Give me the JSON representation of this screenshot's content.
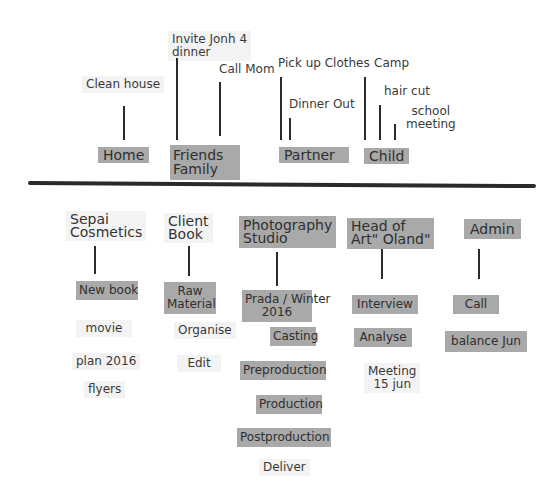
{
  "top_section": {
    "categories": [
      {
        "label": "Home",
        "tasks": [
          "Clean house"
        ]
      },
      {
        "label": "Friends\nFamily",
        "label_lines": [
          "Friends",
          "Family"
        ],
        "tasks": [
          "Invite Jonh 4 dinner",
          "Call Mom"
        ]
      },
      {
        "label": "Partner",
        "tasks": [
          "Pick up Clothes",
          "Dinner Out"
        ]
      },
      {
        "label": "Child",
        "tasks": [
          "Camp",
          "hair cut",
          "school meeting"
        ]
      }
    ],
    "texts": {
      "home": "Home",
      "friends_1": "Friends",
      "friends_2": "Family",
      "partner": "Partner",
      "child": "Child",
      "clean_house": "Clean house",
      "invite_1": "Invite Jonh 4",
      "invite_2": "dinner",
      "call_mom": "Call Mom",
      "pick_up": "Pick up Clothes",
      "dinner_out": "Dinner Out",
      "camp": "Camp",
      "hair_cut": "hair cut",
      "school_1": "school",
      "school_2": "meeting"
    }
  },
  "bottom_section": {
    "columns": [
      {
        "heading": [
          "Sepai",
          "Cosmetics"
        ],
        "items": [
          "New book",
          "movie",
          "plan 2016",
          "flyers"
        ]
      },
      {
        "heading": [
          "Client",
          "Book"
        ],
        "items": [
          "Raw Material",
          "Organise",
          "Edit"
        ]
      },
      {
        "heading": [
          "Photography",
          "Studio"
        ],
        "items": [
          "Prada / Winter 2016",
          "Casting",
          "Preproduction",
          "Production",
          "Postproduction",
          "Deliver"
        ]
      },
      {
        "heading": [
          "Head  of",
          "Art\" Oland\""
        ],
        "items": [
          "Interview",
          "Analyse",
          "Meeting 15 jun"
        ]
      },
      {
        "heading": [
          "Admin"
        ],
        "items": [
          "Call",
          "balance  Jun"
        ]
      }
    ],
    "texts": {
      "sepai_1": "Sepai",
      "sepai_2": "Cosmetics",
      "new_book": "New book",
      "movie": "movie",
      "plan": "plan 2016",
      "flyers": "flyers",
      "client_1": "Client",
      "client_2": "Book",
      "raw_1": "Raw",
      "raw_2": "Material",
      "organise": "Organise",
      "edit": "Edit",
      "photo_1": "Photography",
      "photo_2": "Studio",
      "prada_1": "Prada / Winter",
      "prada_2": "2016",
      "casting": "Casting",
      "preproduction": "Preproduction",
      "production": "Production",
      "postproduction": "Postproduction",
      "deliver": "Deliver",
      "head_1": "Head  of",
      "head_2": "Art\" Oland\"",
      "interview": "Interview",
      "analyse": "Analyse",
      "meeting_1": "Meeting",
      "meeting_2": "15 jun",
      "admin": "Admin",
      "call": "Call",
      "balance": "balance  Jun"
    }
  },
  "colors": {
    "tag_fill": "#a9a9a9",
    "note_fill": "#f3f3f3",
    "line": "#2b2b2b"
  }
}
